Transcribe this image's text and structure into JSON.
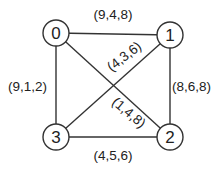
{
  "graph": {
    "nodes": [
      {
        "id": "0",
        "label": "0"
      },
      {
        "id": "1",
        "label": "1"
      },
      {
        "id": "2",
        "label": "2"
      },
      {
        "id": "3",
        "label": "3"
      }
    ],
    "edges": [
      {
        "from": "0",
        "to": "1",
        "label": "(9,4,8)"
      },
      {
        "from": "1",
        "to": "2",
        "label": "(8,6,8)"
      },
      {
        "from": "3",
        "to": "2",
        "label": "(4,5,6)"
      },
      {
        "from": "0",
        "to": "3",
        "label": "(9,1,2)"
      },
      {
        "from": "3",
        "to": "1",
        "label": "(4,3,6)"
      },
      {
        "from": "0",
        "to": "2",
        "label": "(1,4,8)"
      }
    ]
  }
}
